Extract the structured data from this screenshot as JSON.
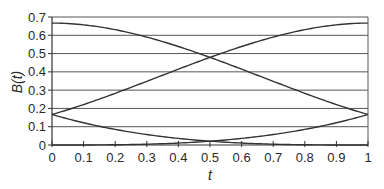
{
  "chart_data": {
    "type": "line",
    "title": "",
    "xlabel": "t",
    "ylabel": "B(t)",
    "xlim": [
      0,
      1
    ],
    "ylim": [
      0,
      0.7
    ],
    "grid": "horizontal",
    "legend": "none",
    "x_ticks": [
      "0",
      "0.1",
      "0.2",
      "0.3",
      "0.4",
      "0.5",
      "0.6",
      "0.7",
      "0.8",
      "0.9",
      "1"
    ],
    "y_ticks": [
      "0",
      "0.1",
      "0.2",
      "0.3",
      "0.4",
      "0.5",
      "0.6",
      "0.7"
    ],
    "x": [
      0,
      0.1,
      0.2,
      0.3,
      0.4,
      0.5,
      0.6,
      0.7,
      0.8,
      0.9,
      1.0
    ],
    "series": [
      {
        "name": "B0(t)",
        "values": [
          0.167,
          0.122,
          0.085,
          0.057,
          0.036,
          0.021,
          0.011,
          0.005,
          0.001,
          0.0,
          0.0
        ]
      },
      {
        "name": "B1(t)",
        "values": [
          0.667,
          0.657,
          0.632,
          0.594,
          0.544,
          0.479,
          0.408,
          0.33,
          0.252,
          0.177,
          0.167
        ]
      },
      {
        "name": "B2(t)",
        "values": [
          0.167,
          0.216,
          0.277,
          0.343,
          0.412,
          0.479,
          0.541,
          0.597,
          0.642,
          0.667,
          0.667
        ]
      },
      {
        "name": "B3(t)",
        "values": [
          0.0,
          0.0,
          0.001,
          0.005,
          0.011,
          0.021,
          0.036,
          0.057,
          0.085,
          0.122,
          0.167
        ]
      }
    ],
    "line_color": "#333333",
    "grid_color": "#555555"
  },
  "labels": {
    "xlabel": "t",
    "ylabel": "B(t)"
  }
}
